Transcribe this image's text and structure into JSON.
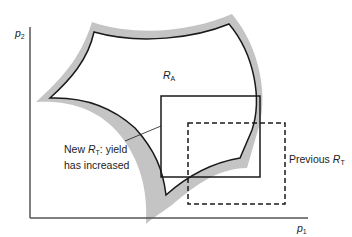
{
  "diagram": {
    "axes": {
      "y_label": "p",
      "y_label_sub": "2",
      "x_label": "p",
      "x_label_sub": "1"
    },
    "region_acceptability": {
      "label": "R",
      "label_sub": "A"
    },
    "new_tolerance_region": {
      "label_line1_prefix": "New ",
      "label_symbol": "R",
      "label_sub": "T",
      "label_line1_suffix": ": yield",
      "label_line2": "has increased",
      "style": "solid"
    },
    "previous_tolerance_region": {
      "label_prefix": "Previous ",
      "label_symbol": "R",
      "label_sub": "T",
      "style": "dashed"
    },
    "colors": {
      "outline": "#1a1a1a",
      "shading": "#c4c4c4",
      "axis": "#555555"
    }
  }
}
